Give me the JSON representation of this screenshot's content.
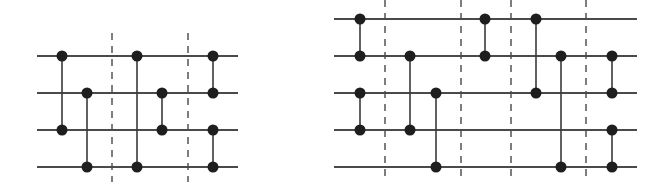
{
  "colors": {
    "wire": "#4a4a4a",
    "gate": "#1e1e1e",
    "barrier": "#3a3a3a",
    "background": "#ffffff"
  },
  "diagrams": [
    {
      "name": "left-circuit",
      "wires": 4,
      "columns": [
        {
          "slot": 1,
          "gates": [
            [
              1,
              3
            ]
          ]
        },
        {
          "slot": 2,
          "gates": [
            [
              2,
              4
            ]
          ]
        },
        {
          "barrier": true
        },
        {
          "slot": 3,
          "gates": [
            [
              1,
              4
            ]
          ]
        },
        {
          "slot": 4,
          "gates": [
            [
              2,
              3
            ]
          ]
        },
        {
          "barrier": true
        },
        {
          "slot": 5,
          "gates": [
            [
              1,
              2
            ],
            [
              3,
              4
            ]
          ]
        }
      ]
    },
    {
      "name": "right-circuit",
      "wires": 5,
      "columns": [
        {
          "slot": 1,
          "gates": [
            [
              1,
              2
            ],
            [
              3,
              4
            ]
          ]
        },
        {
          "barrier": true
        },
        {
          "slot": 2,
          "gates": [
            [
              2,
              4
            ]
          ]
        },
        {
          "slot": 3,
          "gates": [
            [
              3,
              5
            ]
          ]
        },
        {
          "barrier": true
        },
        {
          "slot": 4,
          "gates": [
            [
              1,
              2
            ]
          ]
        },
        {
          "barrier": true
        },
        {
          "slot": 5,
          "gates": [
            [
              1,
              3
            ]
          ]
        },
        {
          "slot": 6,
          "gates": [
            [
              2,
              5
            ]
          ]
        },
        {
          "barrier": true
        },
        {
          "slot": 7,
          "gates": [
            [
              2,
              3
            ],
            [
              4,
              5
            ]
          ]
        }
      ]
    }
  ]
}
